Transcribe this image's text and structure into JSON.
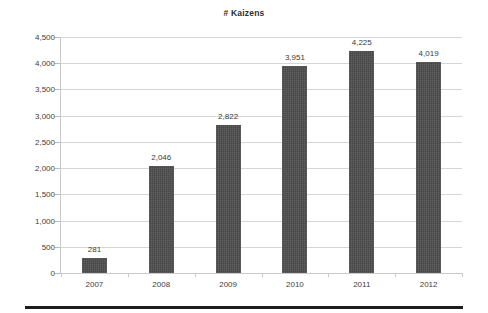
{
  "chart_data": {
    "type": "bar",
    "title": "# Kaizens",
    "xlabel": "",
    "ylabel": "",
    "categories": [
      "2007",
      "2008",
      "2009",
      "2010",
      "2011",
      "2012"
    ],
    "values": [
      281,
      2046,
      2822,
      3951,
      4225,
      4019
    ],
    "value_labels": [
      "281",
      "2,046",
      "2,822",
      "3,951",
      "4,225",
      "4,019"
    ],
    "ylim": [
      0,
      4500
    ],
    "ytick_step": 500,
    "ytick_labels": [
      "0",
      "500",
      "1,000",
      "1,500",
      "2,000",
      "2,500",
      "3,000",
      "3,500",
      "4,000",
      "4,500"
    ],
    "ytick_values": [
      0,
      500,
      1000,
      1500,
      2000,
      2500,
      3000,
      3500,
      4000,
      4500
    ],
    "grid": true,
    "legend": false,
    "legend_position": "none",
    "series": [
      {
        "name": "# Kaizens",
        "values": [
          281,
          2046,
          2822,
          3951,
          4225,
          4019
        ],
        "color": "#4e4e4e"
      }
    ],
    "colors": {
      "bar": "#4e4e4e",
      "gridline": "#d6d6d6",
      "axis": "#c9c9c9",
      "text": "#3a3a3a",
      "background": "#ffffff",
      "rule": "#1c1c1c"
    }
  }
}
